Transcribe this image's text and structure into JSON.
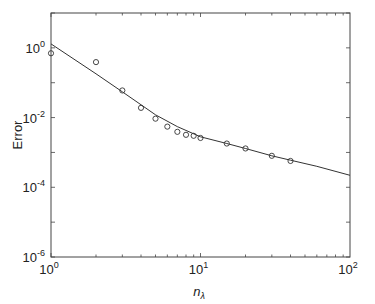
{
  "chart_data": {
    "type": "scatter",
    "title": "",
    "xlabel": "n_λ",
    "xlabel_main": "n",
    "xlabel_sub": "λ",
    "ylabel": "Error",
    "xscale": "log",
    "yscale": "log",
    "xlim": [
      1,
      100
    ],
    "ylim": [
      1e-06,
      10
    ],
    "grid": false,
    "legend": null,
    "x_ticks": [
      {
        "base": "10",
        "exp": "0",
        "value": 1
      },
      {
        "base": "10",
        "exp": "1",
        "value": 10
      },
      {
        "base": "10",
        "exp": "2",
        "value": 100
      }
    ],
    "y_ticks": [
      {
        "base": "10",
        "exp": "0",
        "value": 1
      },
      {
        "base": "10",
        "exp": "-2",
        "value": 0.01
      },
      {
        "base": "10",
        "exp": "-4",
        "value": 0.0001
      },
      {
        "base": "10",
        "exp": "-6",
        "value": 1e-06
      }
    ],
    "series": [
      {
        "name": "measured",
        "kind": "markers",
        "marker": "open-circle",
        "x": [
          1,
          2,
          3,
          4,
          5,
          6,
          7,
          8,
          9,
          10,
          15,
          20,
          30,
          40
        ],
        "y": [
          0.7,
          0.39,
          0.06,
          0.019,
          0.0093,
          0.0055,
          0.0039,
          0.0032,
          0.003,
          0.0026,
          0.0018,
          0.0013,
          0.0008,
          0.00057
        ]
      },
      {
        "name": "model",
        "kind": "line",
        "x": [
          1,
          2,
          3,
          5,
          7,
          10,
          15,
          20,
          30,
          40,
          60,
          100
        ],
        "y": [
          1.3,
          0.18,
          0.055,
          0.012,
          0.0055,
          0.0028,
          0.0018,
          0.0013,
          0.0008,
          0.0006,
          0.0004,
          0.00022
        ]
      }
    ]
  }
}
